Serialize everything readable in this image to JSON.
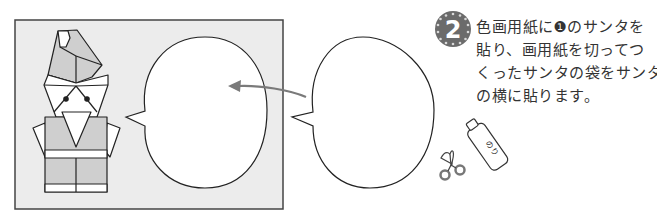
{
  "step": {
    "number": "2",
    "badge_color": "#6b6b6b",
    "lines": [
      "色画用紙に❶のサンタを",
      "貼り、画用紙を切ってつ",
      "くったサンタの袋をサンタ",
      "の横に貼ります。"
    ]
  },
  "illustration": {
    "panel_color": "#ececec",
    "santa_fill": "#cfcfcf",
    "arrow_color": "#7a7a7a",
    "glue_label": "のり",
    "tools": [
      "scissors-icon",
      "glue-bottle-icon"
    ]
  }
}
